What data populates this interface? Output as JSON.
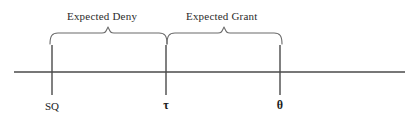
{
  "figure": {
    "type": "number-line-diagram",
    "width": 417,
    "height": 120,
    "background_color": "#ffffff",
    "line_color": "#4a4a4a",
    "text_color": "#2b2b2b"
  },
  "axis": {
    "name": "horizontal-number-line",
    "x_start": 14,
    "x_end": 405,
    "y": 72
  },
  "ticks": [
    {
      "id": "sq",
      "label": "SQ",
      "x": 52,
      "top": 45,
      "bottom": 95,
      "is_greek": false
    },
    {
      "id": "tau",
      "label": "τ",
      "x": 166,
      "top": 45,
      "bottom": 95,
      "is_greek": true
    },
    {
      "id": "theta",
      "label": "θ",
      "x": 280,
      "top": 45,
      "bottom": 95,
      "is_greek": true
    }
  ],
  "regions": [
    {
      "id": "expected-deny",
      "label": "Expected Deny",
      "from_tick": "sq",
      "to_tick": "tau",
      "brace_left_x": 50,
      "brace_right_x": 167,
      "brace_peak_x": 108,
      "label_x": 67,
      "label_y": 10
    },
    {
      "id": "expected-grant",
      "label": "Expected Grant",
      "from_tick": "tau",
      "to_tick": "theta",
      "brace_left_x": 167,
      "brace_right_x": 282,
      "brace_peak_x": 224,
      "label_x": 186,
      "label_y": 10
    }
  ],
  "labels": {
    "sq": "SQ",
    "tau": "τ",
    "theta": "θ",
    "expected_deny": "Expected Deny",
    "expected_grant": "Expected Grant"
  }
}
